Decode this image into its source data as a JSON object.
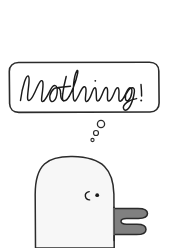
{
  "panel": {
    "width": 171,
    "height": 248,
    "background_color": "#ffffff",
    "style": "hand-drawn-cartoon"
  },
  "thought_box": {
    "text": "Nothing.",
    "shape": "rounded-rectangle",
    "x": 9,
    "y": 62,
    "width": 150,
    "height": 50,
    "corner_radius": 9,
    "stroke_color": "#2b2b2b",
    "fill_color": "#ffffff",
    "handwriting_color": "#1a1a1a",
    "handwriting_style": "cursive"
  },
  "thought_bubbles": [
    {
      "name": "bubble-large",
      "cx": 101,
      "cy": 124,
      "r": 3.6,
      "stroke_color": "#2b2b2b"
    },
    {
      "name": "bubble-medium",
      "cx": 96,
      "cy": 133,
      "r": 2.5,
      "stroke_color": "#2b2b2b"
    },
    {
      "name": "bubble-small",
      "cx": 92.5,
      "cy": 140,
      "r": 1.5,
      "stroke_color": "#2b2b2b"
    }
  ],
  "character": {
    "name": "blob-bird",
    "body_fill_color": "#f7f7f7",
    "outline_color": "#2b2b2b",
    "body_top_y": 157,
    "body_left_x": 35,
    "body_right_x": 114,
    "face": {
      "eye_dot": {
        "cx": 97,
        "cy": 195,
        "r": 1.7,
        "color": "#1a1a1a"
      },
      "eye_curve": {
        "cx": 87,
        "cy": 196,
        "color": "#1a1a1a",
        "shape": "c-curve"
      }
    },
    "wing": {
      "name": "flipper",
      "fill_color": "#808080",
      "outline_color": "#2b2b2b",
      "x": 113,
      "y": 207,
      "width": 35,
      "height": 33,
      "prongs": 2
    }
  }
}
